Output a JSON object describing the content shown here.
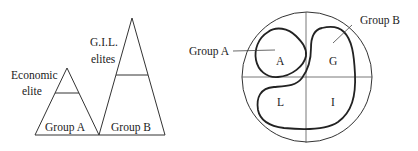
{
  "left_diagram": {
    "labels": {
      "gil_line1": "G.I.L.",
      "gil_line2": "elites",
      "econ_line1": "Economic",
      "econ_line2": "elite",
      "group_a": "Group A",
      "group_b": "Group B"
    }
  },
  "right_diagram": {
    "labels": {
      "group_a": "Group A",
      "group_b": "Group B",
      "quadrant_a": "A",
      "quadrant_g": "G",
      "quadrant_l": "L",
      "quadrant_i": "I"
    }
  },
  "colors": {
    "line": "#333333",
    "thick_line": "#222222",
    "text": "#222222"
  }
}
